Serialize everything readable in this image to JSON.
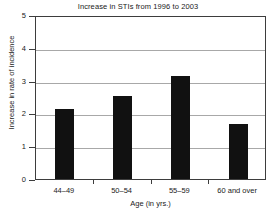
{
  "chart_data": {
    "type": "bar",
    "title": "Increase in STIs from 1996 to 2003",
    "xlabel": "Age (in yrs.)",
    "ylabel": "Increase in rate of incidence",
    "categories": [
      "44–49",
      "50–54",
      "55–59",
      "60 and over"
    ],
    "values": [
      2.13,
      2.53,
      3.15,
      1.67
    ],
    "ylim": [
      0,
      5
    ],
    "yticks": [
      0,
      1,
      2,
      3,
      4,
      5
    ],
    "ytick_labels": [
      "0",
      "1",
      "2",
      "3",
      "4",
      "5"
    ],
    "grid": true,
    "legend": "none",
    "bar_color": "#111111",
    "grid_color": "#a8a8a8",
    "axis_color": "#3d3d3d",
    "background_color": "#ffffff"
  }
}
